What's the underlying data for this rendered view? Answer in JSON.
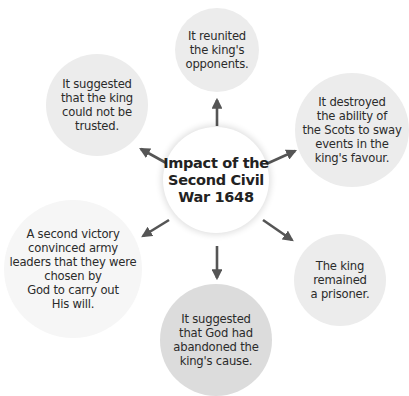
{
  "diagram": {
    "type": "spider-diagram",
    "center": {
      "label": "Impact of the\nSecond Civil\nWar 1648"
    },
    "nodes": [
      {
        "id": "top",
        "position": "top",
        "text": "It reunited\nthe king's\nopponents.",
        "fill": "#ececec"
      },
      {
        "id": "top-left",
        "position": "upper-left",
        "text": "It suggested\nthat the king\ncould not be\ntrusted.",
        "fill": "#ececec"
      },
      {
        "id": "top-right",
        "position": "upper-right",
        "text": "It destroyed\nthe ability of\nthe Scots to sway\nevents in the\nking's favour.",
        "fill": "#ececec"
      },
      {
        "id": "bottom-left",
        "position": "lower-left",
        "text": "A second victory\nconvinced army\nleaders that they were\nchosen by\nGod to carry out\nHis will.",
        "fill": "#f6f6f6"
      },
      {
        "id": "bottom-right",
        "position": "lower-right",
        "text": "The king\nremained\na prisoner.",
        "fill": "#ececec"
      },
      {
        "id": "bottom",
        "position": "bottom",
        "text": "It suggested\nthat God had\nabandoned the\nking's cause.",
        "fill": "#dcdcdc"
      }
    ],
    "arrow_color": "#555555"
  }
}
